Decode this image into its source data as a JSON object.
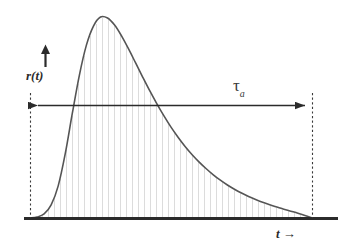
{
  "figure": {
    "background_color": "#ffffff",
    "width": 338,
    "height": 250
  },
  "labels": {
    "y_axis": "r(t)",
    "x_axis": "t",
    "x_axis_arrow": "→",
    "interval_symbol": "τ",
    "interval_subscript": "a"
  },
  "colors": {
    "curve": "#555555",
    "baseline": "#2b2b2b",
    "hatch": "#dcdcdc",
    "dashed": "#3a3a3a",
    "arrow": "#2b2b2b",
    "text": "#2b2b2b"
  },
  "geometry": {
    "baseline_y": 218,
    "left_marker_x": 30,
    "right_marker_x": 312,
    "span_arrow_y": 105,
    "hatch_spacing": 6
  },
  "chart_data": {
    "type": "area",
    "title": "",
    "xlabel": "t",
    "ylabel": "r(t)",
    "legend": [],
    "grid": false,
    "xlim": [
      0,
      1
    ],
    "ylim": [
      0,
      1
    ],
    "annotations": [
      {
        "name": "interval-span",
        "text": "τa",
        "from_x": 0,
        "to_x": 1,
        "style": "double-headed-arrow"
      },
      {
        "name": "left-boundary",
        "text": "",
        "at_x": 0,
        "style": "dashed-vertical"
      },
      {
        "name": "right-boundary",
        "text": "",
        "at_x": 1,
        "style": "dashed-vertical"
      }
    ],
    "series": [
      {
        "name": "r(t)",
        "fill": "vertical-hatch",
        "x": [
          0.0,
          0.025,
          0.05,
          0.075,
          0.1,
          0.125,
          0.15,
          0.175,
          0.2,
          0.225,
          0.25,
          0.275,
          0.3,
          0.325,
          0.35,
          0.375,
          0.4,
          0.425,
          0.45,
          0.475,
          0.5,
          0.525,
          0.55,
          0.575,
          0.6,
          0.625,
          0.65,
          0.675,
          0.7,
          0.725,
          0.75,
          0.775,
          0.8,
          0.825,
          0.85,
          0.875,
          0.9,
          0.925,
          0.95,
          0.975,
          1.0
        ],
        "values": [
          0.0,
          0.005,
          0.02,
          0.065,
          0.16,
          0.32,
          0.52,
          0.71,
          0.86,
          0.955,
          1.0,
          0.995,
          0.96,
          0.905,
          0.84,
          0.77,
          0.7,
          0.632,
          0.568,
          0.508,
          0.452,
          0.402,
          0.356,
          0.315,
          0.278,
          0.245,
          0.215,
          0.188,
          0.164,
          0.143,
          0.124,
          0.107,
          0.092,
          0.078,
          0.066,
          0.055,
          0.044,
          0.034,
          0.024,
          0.013,
          0.0
        ]
      }
    ]
  }
}
